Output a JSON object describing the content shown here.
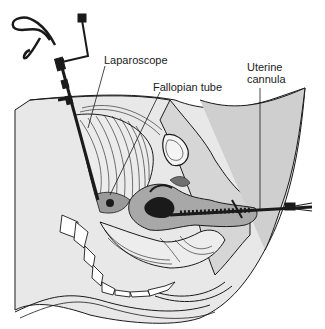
{
  "figure": {
    "labels": {
      "laparoscope": "Laparoscope",
      "fallopian_tube": "Fallopian tube",
      "uterine_cannula_line1": "Uterine",
      "uterine_cannula_line2": "cannula"
    },
    "colors": {
      "background": "#ffffff",
      "tissue_light": "#e6e6e6",
      "tissue_mid": "#c8c8c8",
      "tissue_dark": "#8a8a8a",
      "ink": "#1a1a1a"
    }
  }
}
